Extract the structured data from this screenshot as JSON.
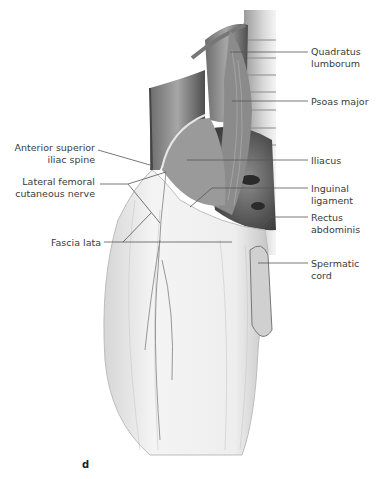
{
  "figure": {
    "panel_letter": "d",
    "labels_right": [
      {
        "id": "quadratus-lumborum",
        "text": "Quadratus\nlumborum",
        "x": 311,
        "y": 46,
        "line": [
          230,
          52,
          308,
          52
        ]
      },
      {
        "id": "psoas-major",
        "text": "Psoas major",
        "x": 311,
        "y": 96,
        "line": [
          232,
          101,
          308,
          101
        ]
      },
      {
        "id": "iliacus",
        "text": "Iliacus",
        "x": 311,
        "y": 155,
        "line": [
          187,
          160,
          308,
          160
        ]
      },
      {
        "id": "inguinal-ligament",
        "text": "Inguinal\nligament",
        "x": 311,
        "y": 183,
        "line": [
          308,
          188,
          212,
          188,
          190,
          207
        ]
      },
      {
        "id": "rectus-abdominis",
        "text": "Rectus\nabdominis",
        "x": 311,
        "y": 212,
        "line": [
          308,
          217,
          270,
          217,
          262,
          226
        ]
      },
      {
        "id": "spermatic-cord",
        "text": "Spermatic\ncord",
        "x": 311,
        "y": 258,
        "line": [
          258,
          263,
          308,
          263
        ]
      }
    ],
    "labels_left": [
      {
        "id": "anterior-superior-iliac-spine",
        "text": "Anterior superior\niliac spine",
        "right": 286,
        "y": 142,
        "line": [
          98,
          148,
          150,
          165
        ]
      },
      {
        "id": "lateral-femoral-cutaneous-nerve",
        "text": "Lateral femoral\ncutaneous nerve",
        "right": 286,
        "y": 176,
        "line": [
          100,
          184,
          128,
          184,
          166,
          172,
          128,
          184,
          160,
          223
        ]
      },
      {
        "id": "fascia-lata",
        "text": "Fascia lata",
        "right": 280,
        "y": 237,
        "line": [
          104,
          242,
          232,
          242,
          123,
          242,
          151,
          213
        ]
      }
    ],
    "colors": {
      "label_text": "#3a3a3a",
      "leader_line": "#555555",
      "muscle_dark": "#5a5a5a",
      "fascia_light": "#ededed"
    }
  }
}
